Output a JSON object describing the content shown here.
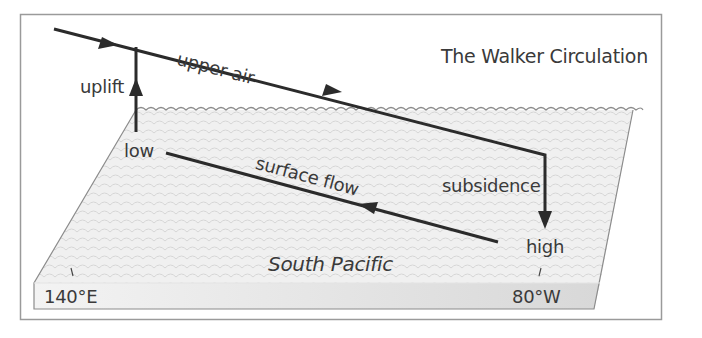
{
  "title": "The Walker Circulation",
  "labels": {
    "upper_air": "upper air",
    "uplift": "uplift",
    "low": "low",
    "surface_flow": "surface flow",
    "subsidence": "subsidence",
    "high": "high",
    "ocean": "South Pacific",
    "west_longitude": "140°E",
    "east_longitude": "80°W"
  },
  "colors": {
    "frame": "#9a9a9a",
    "arrow": "#2b2b2b",
    "text": "#3a3a3a",
    "sea_top": "#efefef",
    "sea_wave": "#d2d2d2",
    "sea_front": "#dcdcdc",
    "sea_edge": "#8c8c8c"
  }
}
